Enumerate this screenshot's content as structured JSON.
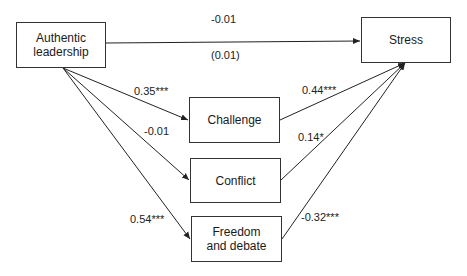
{
  "nodes": {
    "authentic": {
      "label_line1": "Authentic",
      "label_line2": "leadership"
    },
    "stress": {
      "label": "Stress"
    },
    "challenge": {
      "label": "Challenge"
    },
    "conflict": {
      "label": "Conflict"
    },
    "freedom": {
      "label_line1": "Freedom",
      "label_line2": "and debate"
    }
  },
  "edges": {
    "direct": {
      "coef": "-0.01",
      "indirect": "(0.01)"
    },
    "al_challenge": {
      "coef": "0.35***"
    },
    "al_conflict": {
      "coef": "-0.01"
    },
    "al_freedom": {
      "coef": "0.54***"
    },
    "challenge_stress": {
      "coef": "0.44***"
    },
    "conflict_stress": {
      "coef": "0.14*"
    },
    "freedom_stress": {
      "coef": "-0.32***"
    }
  }
}
